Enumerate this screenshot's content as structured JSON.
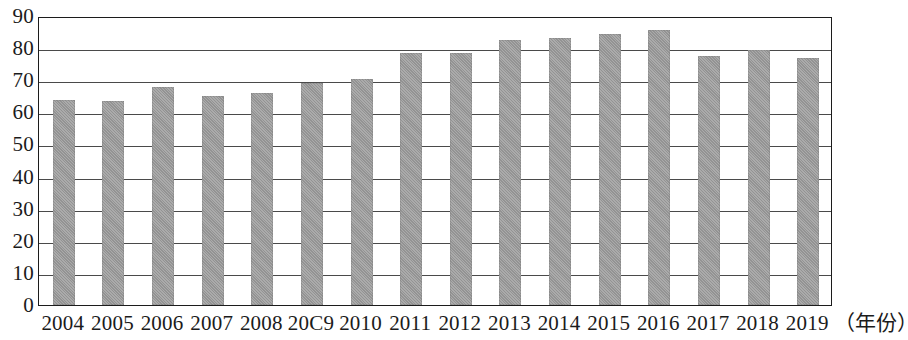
{
  "chart_data": {
    "type": "bar",
    "title": "",
    "xlabel": "（年份）",
    "ylabel": "",
    "categories": [
      "2004",
      "2005",
      "2006",
      "2007",
      "2008",
      "20C9",
      "2010",
      "2011",
      "2012",
      "2013",
      "2014",
      "2015",
      "2016",
      "2017",
      "2018",
      "2019"
    ],
    "values": [
      64,
      63.5,
      68,
      65,
      66,
      69,
      70.5,
      78.5,
      78.5,
      82.5,
      83,
      84.5,
      85.5,
      77.5,
      79.5,
      77
    ],
    "ylim": [
      0,
      90
    ],
    "ytick_labels": [
      "90",
      "80",
      "70",
      "60",
      "50",
      "40",
      "30",
      "20",
      "10",
      "0"
    ],
    "ytick_values": [
      90,
      80,
      70,
      60,
      50,
      40,
      30,
      20,
      10,
      0
    ],
    "grid": true,
    "legend": null,
    "series": [
      {
        "name": "",
        "values": [
          64,
          63.5,
          68,
          65,
          66,
          69,
          70.5,
          78.5,
          78.5,
          82.5,
          83,
          84.5,
          85.5,
          77.5,
          79.5,
          77
        ]
      }
    ],
    "colors": {
      "bar": "#9b9b9b",
      "axis": "#1c1c1c",
      "gridline": "#4a4a4a",
      "text": "#1b1b1b",
      "background": "#ffffff"
    }
  }
}
